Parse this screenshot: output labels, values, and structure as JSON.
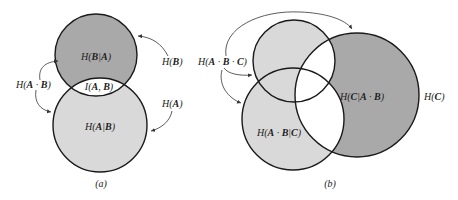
{
  "diagram_a": {
    "caption": "(a)",
    "regions": {
      "b_given_a": {
        "pre": "H(",
        "b1": "B",
        "mid": "|",
        "b2": "A",
        "post": ")"
      },
      "mutual": {
        "pre": "I(",
        "b1": "A",
        "mid": ", ",
        "b2": "B",
        "post": ")"
      },
      "a_given_b": {
        "pre": "H(",
        "b1": "A",
        "mid": "|",
        "b2": "B",
        "post": ")"
      }
    },
    "labels": {
      "h_b": {
        "pre": "H(",
        "b1": "B",
        "post": ")"
      },
      "h_a": {
        "pre": "H(",
        "b1": "A",
        "post": ")"
      },
      "h_ab": {
        "pre": "H(",
        "b1": "A",
        "mid": " · ",
        "b2": "B",
        "post": ")"
      }
    },
    "colors": {
      "upper_circle": "#a9a9a9",
      "lower_circle": "#d9d9d9",
      "intersection": "#ffffff",
      "stroke": "#1a1a1a"
    }
  },
  "diagram_b": {
    "caption": "(b)",
    "regions": {
      "c_given_ab": {
        "pre": "H(",
        "b1": "C",
        "mid": "|",
        "b2": "A",
        "mid2": " · ",
        "b3": "B",
        "post": ")"
      },
      "ab_given_c": {
        "pre": "H(",
        "b1": "A",
        "mid": " · ",
        "b2": "B",
        "mid2": "|",
        "b3": "C",
        "post": ")"
      }
    },
    "labels": {
      "h_c": {
        "pre": "H(",
        "b1": "C",
        "post": ")"
      },
      "h_abc": {
        "pre": "H(",
        "b1": "A",
        "mid": " · ",
        "b2": "B",
        "mid2": " · ",
        "b3": "C",
        "post": ")"
      }
    },
    "colors": {
      "ab_outside_c": "#d9d9d9",
      "c_only": "#a9a9a9",
      "inside_c_overlap": "#ffffff",
      "stroke": "#1a1a1a"
    }
  }
}
